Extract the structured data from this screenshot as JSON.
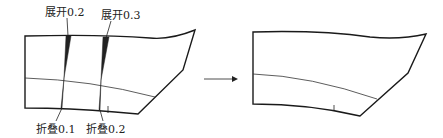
{
  "diagram": {
    "labels": {
      "open_1": "展开0.2",
      "open_2": "展开0.3",
      "fold_1": "折叠0.1",
      "fold_2": "折叠0.2"
    },
    "colors": {
      "line": "#1a1a1a",
      "wedge": "#222222",
      "background": "#ffffff"
    }
  }
}
